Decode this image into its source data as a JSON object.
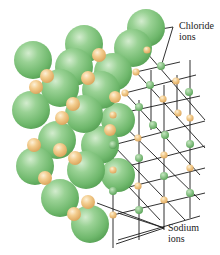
{
  "diagram": {
    "colors": {
      "chloride": "#7cc27a",
      "chloride_highlight": "#c8e8c2",
      "sodium": "#f0c27a",
      "sodium_highlight": "#fbe6bf",
      "lattice_line": "#1a1a1a",
      "background": "#ffffff"
    },
    "labels": {
      "chloride": [
        "Chloride",
        "ions"
      ],
      "sodium": [
        "Sodium",
        "ions"
      ]
    },
    "chloride_spheres": [
      {
        "cx": 146,
        "cy": 28,
        "r": 19
      },
      {
        "cx": 84,
        "cy": 44,
        "r": 19
      },
      {
        "cx": 133,
        "cy": 48,
        "r": 19
      },
      {
        "cx": 33,
        "cy": 60,
        "r": 19
      },
      {
        "cx": 74,
        "cy": 67,
        "r": 19
      },
      {
        "cx": 113,
        "cy": 72,
        "r": 19
      },
      {
        "cx": 60,
        "cy": 88,
        "r": 19
      },
      {
        "cx": 101,
        "cy": 90,
        "r": 19
      },
      {
        "cx": 31,
        "cy": 110,
        "r": 19
      },
      {
        "cx": 84,
        "cy": 114,
        "r": 19
      },
      {
        "cx": 118,
        "cy": 120,
        "r": 17
      },
      {
        "cx": 35,
        "cy": 166,
        "r": 19
      },
      {
        "cx": 86,
        "cy": 170,
        "r": 19
      },
      {
        "cx": 60,
        "cy": 198,
        "r": 19
      },
      {
        "cx": 118,
        "cy": 175,
        "r": 17
      },
      {
        "cx": 90,
        "cy": 224,
        "r": 19
      },
      {
        "cx": 57,
        "cy": 140,
        "r": 19
      },
      {
        "cx": 100,
        "cy": 145,
        "r": 19
      }
    ],
    "sodium_spheres": [
      {
        "cx": 47,
        "cy": 76,
        "r": 7
      },
      {
        "cx": 36,
        "cy": 87,
        "r": 7
      },
      {
        "cx": 99,
        "cy": 55,
        "r": 7
      },
      {
        "cx": 88,
        "cy": 78,
        "r": 7
      },
      {
        "cx": 73,
        "cy": 104,
        "r": 7
      },
      {
        "cx": 62,
        "cy": 118,
        "r": 7
      },
      {
        "cx": 34,
        "cy": 145,
        "r": 7
      },
      {
        "cx": 75,
        "cy": 158,
        "r": 7
      },
      {
        "cx": 60,
        "cy": 150,
        "r": 7
      },
      {
        "cx": 45,
        "cy": 178,
        "r": 7
      },
      {
        "cx": 88,
        "cy": 202,
        "r": 7
      },
      {
        "cx": 74,
        "cy": 214,
        "r": 7
      },
      {
        "cx": 115,
        "cy": 97,
        "r": 6
      },
      {
        "cx": 110,
        "cy": 130,
        "r": 6
      }
    ],
    "lattice_nodes": [
      {
        "x": 147,
        "y": 50,
        "type": "Na"
      },
      {
        "x": 161,
        "y": 66,
        "type": "Cl"
      },
      {
        "x": 136,
        "y": 72,
        "type": "Na"
      },
      {
        "x": 176,
        "y": 81,
        "type": "Na"
      },
      {
        "x": 150,
        "y": 85,
        "type": "Cl"
      },
      {
        "x": 189,
        "y": 92,
        "type": "Cl"
      },
      {
        "x": 125,
        "y": 93,
        "type": "Na"
      },
      {
        "x": 163,
        "y": 99,
        "type": "Na"
      },
      {
        "x": 139,
        "y": 107,
        "type": "Cl"
      },
      {
        "x": 178,
        "y": 113,
        "type": "Na"
      },
      {
        "x": 190,
        "y": 118,
        "type": "Na"
      },
      {
        "x": 113,
        "y": 115,
        "type": "Na"
      },
      {
        "x": 153,
        "y": 125,
        "type": "Cl"
      },
      {
        "x": 165,
        "y": 135,
        "type": "Cl"
      },
      {
        "x": 138,
        "y": 138,
        "type": "Na"
      },
      {
        "x": 190,
        "y": 144,
        "type": "Cl"
      },
      {
        "x": 113,
        "y": 145,
        "type": "Cl"
      },
      {
        "x": 164,
        "y": 155,
        "type": "Na"
      },
      {
        "x": 139,
        "y": 158,
        "type": "Cl"
      },
      {
        "x": 190,
        "y": 168,
        "type": "Na"
      },
      {
        "x": 113,
        "y": 170,
        "type": "Na"
      },
      {
        "x": 164,
        "y": 176,
        "type": "Cl"
      },
      {
        "x": 138,
        "y": 186,
        "type": "Na"
      },
      {
        "x": 190,
        "y": 193,
        "type": "Cl"
      },
      {
        "x": 113,
        "y": 191,
        "type": "Cl"
      },
      {
        "x": 164,
        "y": 200,
        "type": "Na"
      },
      {
        "x": 139,
        "y": 210,
        "type": "Cl"
      },
      {
        "x": 113,
        "y": 215,
        "type": "Na"
      }
    ]
  }
}
